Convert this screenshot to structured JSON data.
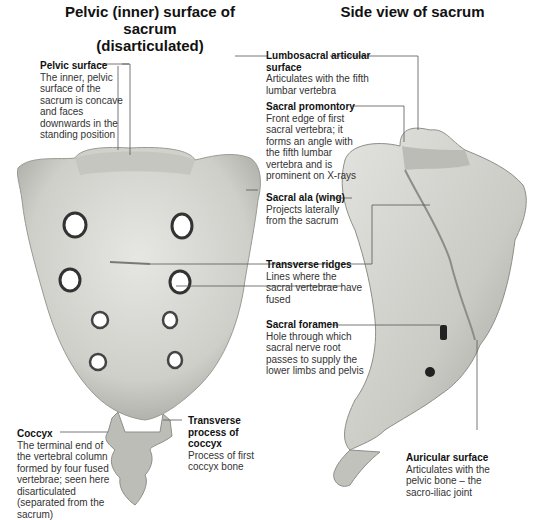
{
  "titles": {
    "left": "Pelvic (inner) surface of sacrum (disarticulated)",
    "left_line1": "Pelvic (inner) surface of sacrum",
    "left_line2": "(disarticulated)",
    "right": "Side view of sacrum"
  },
  "labels": {
    "pelvic_surface": {
      "title": "Pelvic surface",
      "desc": "The inner, pelvic surface of the sacrum is concave and faces downwards in the standing position"
    },
    "lumbosacral": {
      "title": "Lumbosacral articular surface",
      "desc": "Articulates with the fifth lumbar vertebra"
    },
    "promontory": {
      "title": "Sacral promontory",
      "desc": "Front edge of first sacral vertebra; it forms an angle with the fifth lumbar vertebra and is prominent on X-rays"
    },
    "ala": {
      "title": "Sacral ala (wing)",
      "desc": "Projects laterally from the sacrum"
    },
    "ridges": {
      "title": "Transverse ridges",
      "desc": "Lines where the sacral vertebrae have fused"
    },
    "foramen": {
      "title": "Sacral foramen",
      "desc": "Hole through which sacral nerve root passes to supply the lower limbs and pelvis"
    },
    "coccyx": {
      "title": "Coccyx",
      "desc": "The terminal end of the vertebral column formed by four fused vertebrae; seen here disarticulated (separated from the sacrum)"
    },
    "transverse_process": {
      "title": "Transverse process of coccyx",
      "desc": "Process of first coccyx bone"
    },
    "auricular": {
      "title": "Auricular surface",
      "desc": "Articulates with the pelvic bone – the sacro-iliac joint"
    }
  },
  "colors": {
    "bone": "#d6d6d2",
    "bone_shadow": "#a9a9a4",
    "leader": "#555555",
    "text": "#333333"
  }
}
